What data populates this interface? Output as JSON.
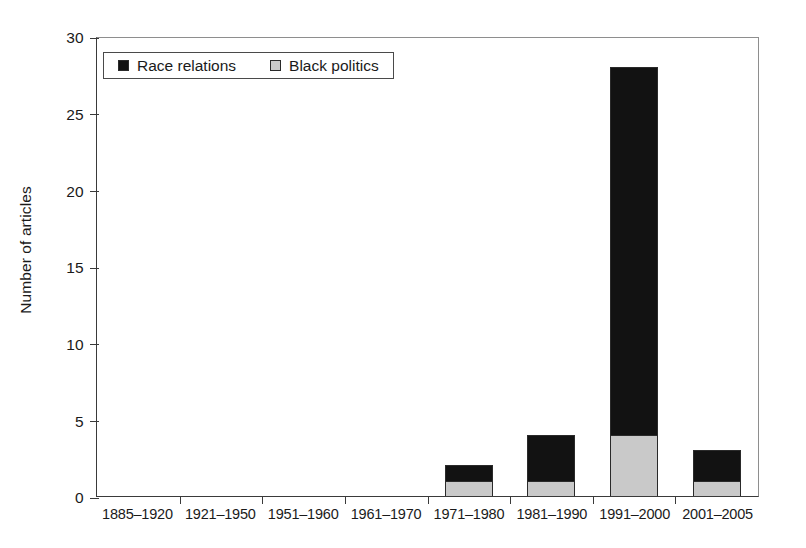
{
  "chart_data": {
    "type": "bar",
    "stacked": true,
    "title": "",
    "subtitle": "",
    "xlabel": "",
    "ylabel": "Number of articles",
    "categories": [
      "1885–1920",
      "1921–1950",
      "1951–1960",
      "1961–1970",
      "1971–1980",
      "1981–1990",
      "1991–2000",
      "2001–2005"
    ],
    "series": [
      {
        "name": "Black politics",
        "color": "#c9c9c9",
        "values": [
          0,
          0,
          0,
          0,
          1,
          1,
          4,
          1
        ]
      },
      {
        "name": "Race relations",
        "color": "#121212",
        "values": [
          0,
          0,
          0,
          0,
          1,
          3,
          24,
          2
        ]
      }
    ],
    "totals": [
      0,
      0,
      0,
      0,
      2,
      4,
      28,
      3
    ],
    "ylim": [
      0,
      30
    ],
    "yticks": [
      0,
      5,
      10,
      15,
      20,
      25,
      30
    ],
    "ytick_labels": [
      "0",
      "5",
      "10",
      "15",
      "20",
      "25",
      "30"
    ],
    "grid": false,
    "legend_position": "top-left",
    "legend_entries": [
      {
        "label": "Race relations",
        "swatch": "black"
      },
      {
        "label": "Black politics",
        "swatch": "gray"
      }
    ]
  },
  "colors": {
    "race_relations": "#121212",
    "black_politics": "#c9c9c9",
    "axis": "#3a3a3a",
    "frame": "#8e8e8e",
    "background": "#ffffff"
  }
}
